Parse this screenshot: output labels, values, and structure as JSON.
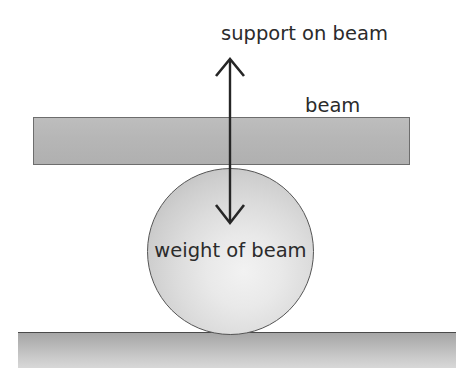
{
  "diagram": {
    "title": "support on beam",
    "canvas": {
      "width": 456,
      "height": 368,
      "background": "#ffffff"
    },
    "labels": {
      "support_on_beam": "support on beam",
      "beam": "beam",
      "weight_of_beam": "weight of beam"
    },
    "colors": {
      "beam_fill": "#b6b6b6",
      "beam_border": "#6d6d6d",
      "sphere_light": "#f2f2f2",
      "sphere_dark": "#b4b4b4",
      "sphere_border": "#555555",
      "ground_top": "#a6a6a6",
      "ground_bottom": "#d8d8d8",
      "ground_line": "#4a4a4a",
      "arrow": "#262626",
      "text": "#2b2b2b"
    },
    "shapes": {
      "beam": {
        "x": 33,
        "y": 117,
        "width": 377,
        "height": 48
      },
      "sphere": {
        "cx": 230,
        "cy": 252,
        "r": 84
      },
      "ground": {
        "x": 18,
        "y": 332,
        "width": 438,
        "height": 36
      }
    },
    "arrows": [
      {
        "name": "support-force-arrow",
        "direction": "up",
        "label": "support on beam",
        "x": 230,
        "tip_y": 59,
        "tail_y": 225
      },
      {
        "name": "weight-force-arrow",
        "direction": "down",
        "label": "weight of beam",
        "x": 230,
        "tip_y": 222,
        "tail_y": 59
      }
    ]
  }
}
